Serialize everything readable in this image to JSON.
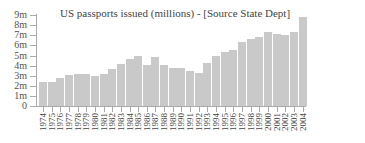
{
  "chart_data": {
    "type": "bar",
    "title": "US passports issued (millions) - [Source State Dept]",
    "xlabel": "",
    "ylabel": "",
    "ylim": [
      0,
      9
    ],
    "yticks": [
      "0",
      "1m",
      "2m",
      "3m",
      "4m",
      "5m",
      "6m",
      "7m",
      "8m",
      "9m"
    ],
    "grid": false,
    "legend": null,
    "categories": [
      "1974",
      "1975",
      "1976",
      "1977",
      "1978",
      "1979",
      "1980",
      "1981",
      "1982",
      "1983",
      "1984",
      "1985",
      "1986",
      "1987",
      "1988",
      "1989",
      "1990",
      "1991",
      "1992",
      "1993",
      "1994",
      "1995",
      "1996",
      "1997",
      "1998",
      "1999",
      "2000",
      "2001",
      "2002",
      "2003",
      "2004"
    ],
    "values": [
      2.4,
      2.35,
      2.8,
      3.1,
      3.2,
      3.15,
      3.0,
      3.2,
      3.7,
      4.2,
      4.7,
      4.95,
      4.1,
      4.85,
      4.1,
      3.75,
      3.75,
      3.45,
      3.3,
      4.25,
      4.95,
      5.3,
      5.55,
      6.3,
      6.6,
      6.8,
      7.3,
      7.15,
      7.05,
      7.3,
      8.85
    ],
    "colors": {
      "bar": "#c9c9c9",
      "axis": "#aaaaaa",
      "text": "#444444"
    }
  }
}
